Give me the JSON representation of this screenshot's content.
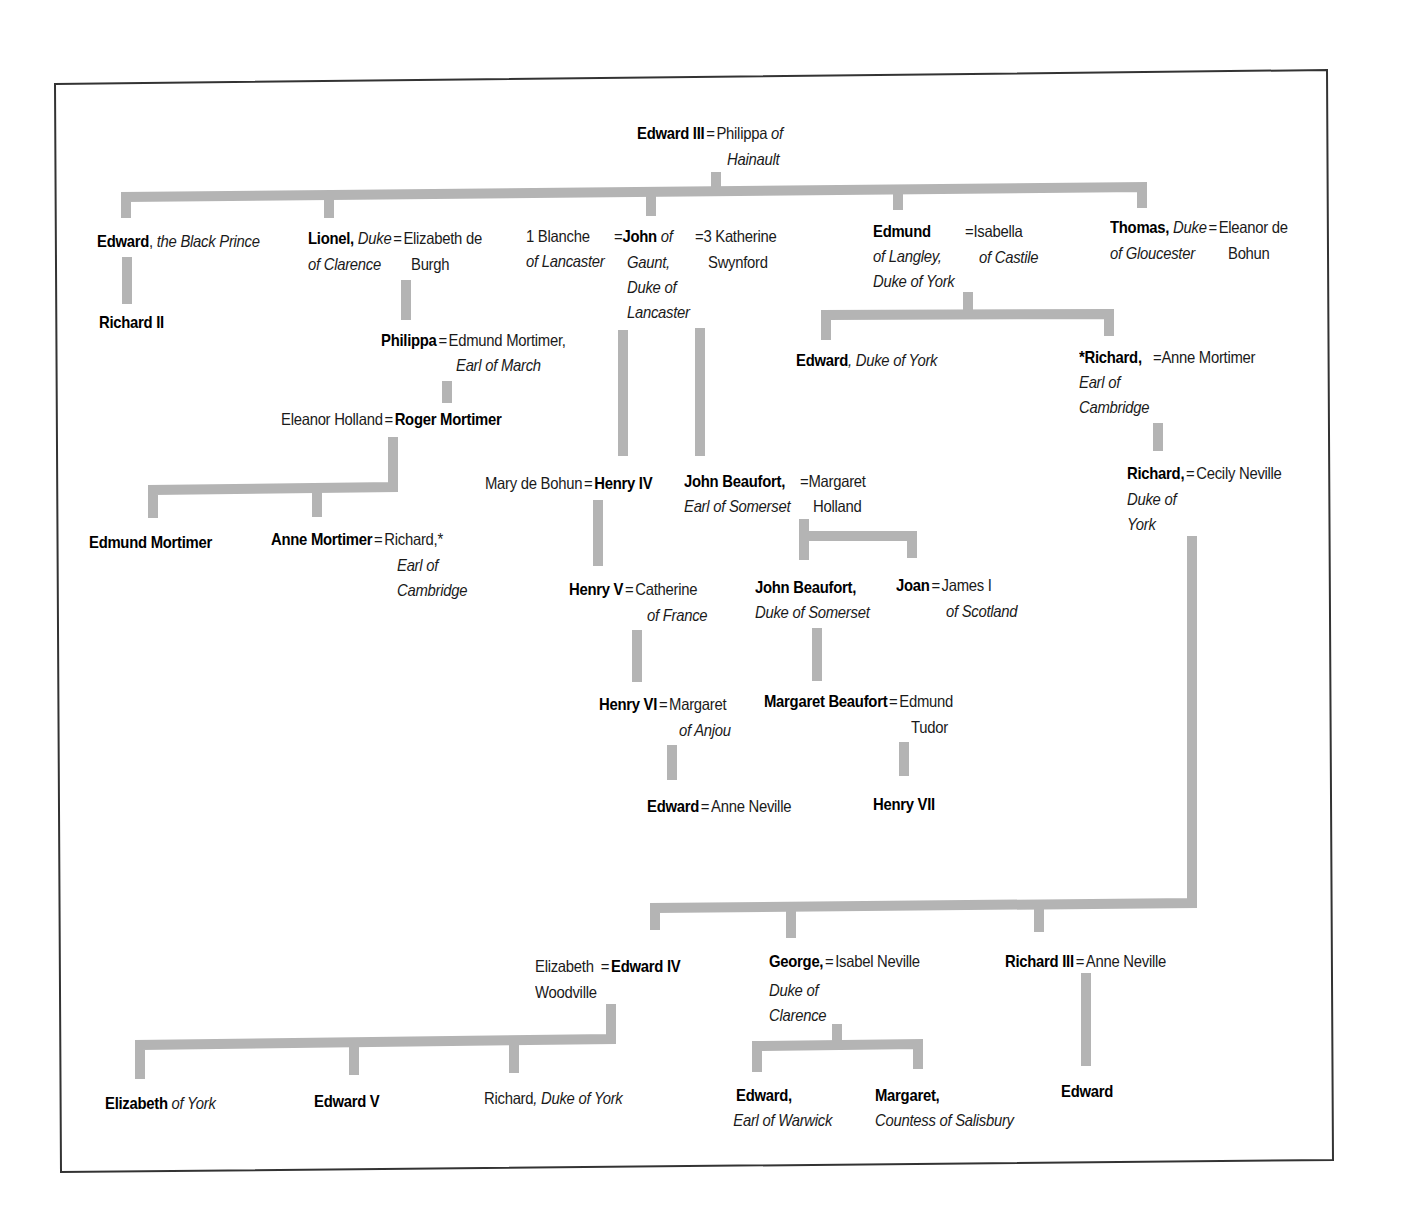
{
  "diagram": {
    "type": "family-tree",
    "connector_color": "#b4b4b4",
    "frame_color": "#333333"
  },
  "nodes": {
    "edward3": {
      "lines": [
        [
          "b",
          "Edward III"
        ],
        [
          "eq",
          "="
        ],
        [
          "r",
          "Philippa "
        ],
        [
          "i",
          "of"
        ]
      ],
      "line2": [
        [
          "i",
          "Hainault"
        ]
      ]
    },
    "blackprince": {
      "lines": [
        [
          "b",
          "Edward"
        ],
        [
          "r",
          ", "
        ],
        [
          "i",
          "the Black Prince"
        ]
      ]
    },
    "richard2": {
      "lines": [
        [
          "b",
          "Richard II"
        ]
      ]
    },
    "lionel": {
      "l1": [
        [
          "b",
          "Lionel, "
        ],
        [
          "i",
          "Duke"
        ],
        [
          "eq",
          "="
        ],
        [
          "r",
          "Elizabeth de"
        ]
      ],
      "l2a": "of Clarence",
      "l2b": "Burgh"
    },
    "gaunt": {
      "blanche1": "1 Blanche",
      "blanche2": "of Lancaster",
      "eq1": "=",
      "john": "John",
      "of": " of",
      "g2": "Gaunt,",
      "g3": "Duke of",
      "g4": "Lancaster",
      "eq3": "=3 Katherine",
      "swyn": "Swynford"
    },
    "edmund": {
      "name": "Edmund",
      "t1": "of Langley,",
      "t2": "Duke of York",
      "spouse1": "=Isabella",
      "spouse2": "of Castile"
    },
    "thomas": {
      "name": "Thomas,",
      "t1": " Duke",
      "eq": "=",
      "spouse1": "Eleanor de",
      "t2": "of Gloucester",
      "spouse2": "Bohun"
    },
    "philippa": {
      "name": "Philippa",
      "eq": "=",
      "spouse": "Edmund Mortimer,",
      "title": "Earl of March"
    },
    "roger": {
      "spouse": "Eleanor Holland",
      "eq": "=",
      "name": "Roger Mortimer"
    },
    "edmundMortimer": {
      "name": "Edmund Mortimer"
    },
    "anneMortimer": {
      "name": "Anne Mortimer",
      "eq": "=",
      "spouse": "Richard,*",
      "t1": "Earl of",
      "t2": "Cambridge"
    },
    "henry4": {
      "spouse": "Mary de Bohun",
      "eq": "=",
      "name": "Henry IV"
    },
    "johnBeaufort1": {
      "name": "John Beaufort,",
      "title": "Earl of Somerset",
      "eq": "=Margaret",
      "spouse2": "Holland"
    },
    "edwardYork": {
      "name": "Edward",
      "title": ", Duke of York"
    },
    "richardCambridge": {
      "name": "*Richard,",
      "eq": "=Anne Mortimer",
      "t1": "Earl of",
      "t2": "Cambridge"
    },
    "richardYork": {
      "name": "Richard,",
      "eq": "=",
      "spouse": "Cecily Neville",
      "t1": "Duke of",
      "t2": "York"
    },
    "henry5": {
      "name": "Henry V",
      "eq": "=",
      "spouse": "Catherine",
      "title": "of France"
    },
    "johnBeaufort2": {
      "name": "John Beaufort,",
      "title": "Duke of Somerset"
    },
    "joan": {
      "name": "Joan",
      "eq": "=",
      "spouse": "James I",
      "title": "of Scotland"
    },
    "henry6": {
      "name": "Henry VI",
      "eq": "=",
      "spouse": "Margaret",
      "title": "of Anjou"
    },
    "margaretBeaufort": {
      "name": "Margaret Beaufort",
      "eq": "=",
      "spouse1": "Edmund",
      "spouse2": "Tudor"
    },
    "edwardLancaster": {
      "name": "Edward",
      "eq": "=",
      "spouse": "Anne Neville"
    },
    "henry7": {
      "name": "Henry VII"
    },
    "edward4": {
      "spouse1": "Elizabeth",
      "eq": "=",
      "name": "Edward IV",
      "spouse2": "Woodville"
    },
    "george": {
      "name": "George,",
      "eq": "=",
      "spouse": "Isabel Neville",
      "t1": "Duke of",
      "t2": "Clarence"
    },
    "richard3": {
      "name": "Richard III",
      "eq": "=",
      "spouse": "Anne Neville"
    },
    "elizabethYork": {
      "name": "Elizabeth",
      "title": " of York"
    },
    "edward5": {
      "name": "Edward V"
    },
    "richardShrewsbury": {
      "name": "Richard",
      "title": ", Duke of York"
    },
    "edwardWarwick": {
      "name": "Edward,",
      "title": "Earl of Warwick"
    },
    "margaretSalisbury": {
      "name": "Margaret,",
      "title": "Countess of Salisbury"
    },
    "edwardMiddleham": {
      "name": "Edward"
    }
  }
}
